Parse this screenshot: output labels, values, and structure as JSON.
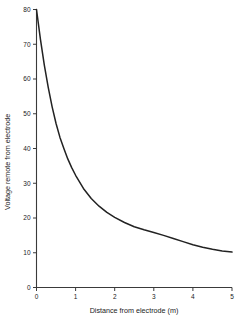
{
  "chart_data": {
    "type": "line",
    "title": "",
    "xlabel": "Distance from electrode (m)",
    "ylabel": "Voltage remote from electrode",
    "xlim": [
      0,
      5
    ],
    "ylim": [
      0,
      80
    ],
    "xticks": [
      "0",
      "1",
      "2",
      "3",
      "4",
      "5"
    ],
    "yticks": [
      "0",
      "10",
      "20",
      "30",
      "40",
      "50",
      "60",
      "70",
      "80"
    ],
    "grid": false,
    "legend": "none",
    "series": [
      {
        "name": "Voltage vs distance",
        "color": "#222222",
        "x": [
          0,
          0.1,
          0.2,
          0.3,
          0.4,
          0.5,
          0.6,
          0.7,
          0.8,
          0.9,
          1.0,
          1.2,
          1.4,
          1.6,
          1.8,
          2.0,
          2.25,
          2.5,
          2.75,
          3.0,
          3.25,
          3.5,
          3.75,
          4.0,
          4.25,
          4.5,
          4.75,
          5.0
        ],
        "values": [
          80.0,
          71.5,
          64.0,
          57.6,
          52.0,
          47.2,
          43.2,
          40.0,
          37.0,
          34.5,
          32.3,
          28.5,
          25.6,
          23.4,
          21.6,
          20.2,
          18.7,
          17.5,
          16.6,
          15.8,
          15.0,
          14.1,
          13.2,
          12.3,
          11.6,
          11.0,
          10.5,
          10.2
        ]
      }
    ]
  },
  "axes": {
    "x_title": "Distance from electrode (m)",
    "y_title": "Voltage remote from electrode"
  }
}
